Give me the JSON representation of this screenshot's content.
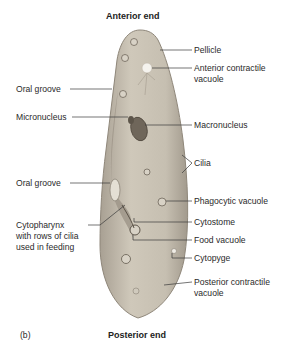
{
  "figure": {
    "title_top": "Anterior end",
    "title_bottom": "Posterior end",
    "panel_label": "(b)"
  },
  "labels": {
    "pellicle": "Pellicle",
    "anterior_cv_1": "Anterior contractile",
    "anterior_cv_2": "vacuole",
    "oral_groove_top": "Oral groove",
    "micronucleus": "Micronucleus",
    "macronucleus": "Macronucleus",
    "cilia": "Cilia",
    "oral_groove_mid": "Oral groove",
    "phagocytic_vacuole": "Phagocytic vacuole",
    "cytopharynx_1": "Cytopharynx",
    "cytopharynx_2": "with rows of cilia",
    "cytopharynx_3": "used in feeding",
    "cytostome": "Cytostome",
    "food_vacuole": "Food vacuole",
    "cytopyge": "Cytopyge",
    "posterior_cv_1": "Posterior contractile",
    "posterior_cv_2": "vacuole"
  },
  "colors": {
    "body_fill": "#c9c2b4",
    "body_edge": "#8f877a",
    "line": "#3a3a3a"
  }
}
